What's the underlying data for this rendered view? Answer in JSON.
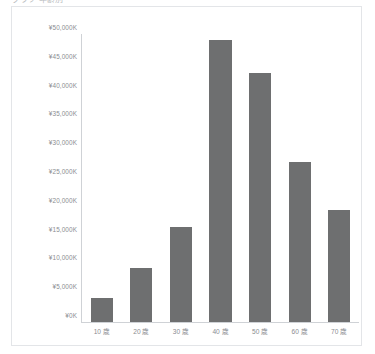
{
  "header": {
    "clipped_title": "グラフ 年齢別"
  },
  "chart_data": {
    "type": "bar",
    "title": "",
    "xlabel": "",
    "ylabel": "",
    "categories": [
      "10 歳",
      "20 歳",
      "30 歳",
      "40 歳",
      "50 歳",
      "60 歳",
      "70 歳"
    ],
    "values": [
      4200,
      9400,
      16500,
      48900,
      43200,
      27800,
      19400
    ],
    "ylim": [
      0,
      50000
    ],
    "ytick_values": [
      0,
      5000,
      10000,
      15000,
      20000,
      25000,
      30000,
      35000,
      40000,
      45000,
      50000
    ],
    "ytick_labels": [
      "¥0K",
      "¥5,000K",
      "¥10,000K",
      "¥15,000K",
      "¥20,000K",
      "¥25,000K",
      "¥30,000K",
      "¥35,000K",
      "¥40,000K",
      "¥45,000K",
      "¥50,000K"
    ],
    "unit": "K",
    "currency_symbol": "¥",
    "grid": false,
    "legend": false,
    "bar_color": "#6e6f70",
    "axis_color": "#cfd2d6",
    "tick_label_color": "#8a8d91",
    "frame_color": "#e3e5e8",
    "background": "#ffffff"
  }
}
